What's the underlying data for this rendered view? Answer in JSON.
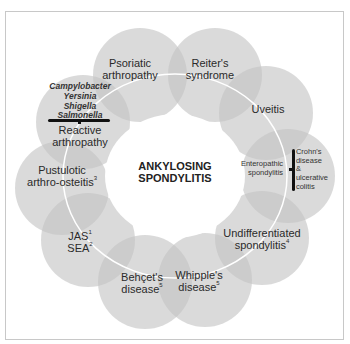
{
  "center_title": {
    "line1": "ANKYLOSING",
    "line2": "SPONDYLITIS"
  },
  "nodes": [
    {
      "id": "psoriatic",
      "line1": "Psoriatic",
      "line2": "arthropathy",
      "sup": ""
    },
    {
      "id": "reiters",
      "line1": "Reiter's",
      "line2": "syndrome",
      "sup": ""
    },
    {
      "id": "uveitis",
      "line1": "Uveitis",
      "line2": "",
      "sup": ""
    },
    {
      "id": "enteropathic",
      "line1": "Enteropathic",
      "line2": "spondylitis",
      "sup": ""
    },
    {
      "id": "undifferentiated",
      "line1": "Undifferentiated",
      "line2": "spondylitis",
      "sup": "4"
    },
    {
      "id": "whipples",
      "line1": "Whipple's",
      "line2": "disease",
      "sup": "5"
    },
    {
      "id": "behcets",
      "line1": "Behçet's",
      "line2": "disease",
      "sup": "5"
    },
    {
      "id": "jas_sea",
      "line1": "JAS",
      "sup1": "1",
      "line2": "SEA",
      "sup": "2"
    },
    {
      "id": "pustulotic",
      "line1": "Pustulotic",
      "line2": "arthro-osteitis",
      "sup": "3"
    },
    {
      "id": "reactive",
      "line1": "Reactive",
      "line2": "arthropathy",
      "sup": ""
    }
  ],
  "reactive_causes": [
    "Campylobacter",
    "Yersinia",
    "Shigella",
    "Salmonella"
  ],
  "enteropathic_causes": [
    "Crohn's",
    "disease",
    "&",
    "ulcerative",
    "colitis"
  ],
  "colors": {
    "circle_fill": "#d9d9d9",
    "overlap_fill": "#bdbdbd",
    "connector_line": "#ffffff",
    "frame_border": "#c8c8c8",
    "text": "#2a2a2a"
  }
}
